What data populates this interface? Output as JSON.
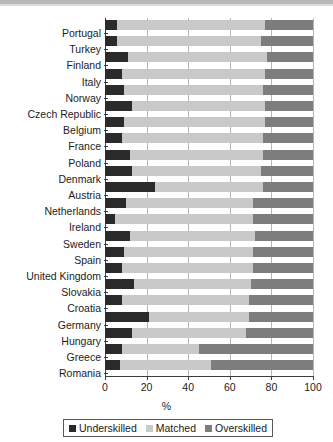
{
  "chart_data": {
    "type": "bar",
    "orientation": "horizontal",
    "stacked": true,
    "title": "",
    "xlabel": "%",
    "ylabel": "",
    "xlim": [
      0,
      100
    ],
    "xticks": [
      0,
      20,
      40,
      60,
      80,
      100
    ],
    "xtick_labels": [
      "0",
      "20",
      "40",
      "60",
      "80",
      "100"
    ],
    "grid": true,
    "legend_position": "bottom",
    "categories": [
      "Portugal",
      "Turkey",
      "Finland",
      "Italy",
      "Norway",
      "Czech Republic",
      "Belgium",
      "France",
      "Poland",
      "Denmark",
      "Austria",
      "Netherlands",
      "Ireland",
      "Sweden",
      "Spain",
      "United Kingdom",
      "Slovakia",
      "Croatia",
      "Germany",
      "Hungary",
      "Greece",
      "Romania"
    ],
    "series": [
      {
        "name": "Underskilled",
        "color": "#2b2b2b",
        "values": [
          6,
          6,
          11,
          8,
          9,
          13,
          9,
          8,
          12,
          13,
          24,
          10,
          5,
          12,
          9,
          8,
          14,
          8,
          21,
          13,
          8,
          7
        ]
      },
      {
        "name": "Matched",
        "color": "#c9c9c9",
        "values": [
          71,
          69,
          67,
          69,
          67,
          64,
          68,
          68,
          64,
          62,
          52,
          61,
          66,
          60,
          62,
          63,
          56,
          61,
          48,
          55,
          37,
          44
        ]
      },
      {
        "name": "Overskilled",
        "color": "#7d7d7d",
        "values": [
          23,
          25,
          22,
          23,
          24,
          23,
          23,
          24,
          24,
          25,
          24,
          29,
          29,
          28,
          29,
          29,
          30,
          31,
          31,
          32,
          55,
          49
        ]
      }
    ],
    "legend": [
      "Underskilled",
      "Matched",
      "Overskilled"
    ]
  }
}
